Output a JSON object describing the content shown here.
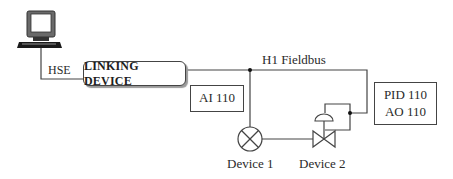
{
  "diagram": {
    "title": "",
    "nodes": {
      "host": {
        "icon": "computer-icon",
        "link_label": "HSE"
      },
      "linking_device": {
        "label": "LINKING DEVICE"
      },
      "bus": {
        "label": "H1 Fieldbus"
      },
      "ai_block": {
        "label": "AI 110"
      },
      "pid_block": {
        "line1": "PID 110",
        "line2": "AO 110"
      },
      "device1": {
        "label": "Device 1",
        "symbol": "instrument-circle-x-icon"
      },
      "device2": {
        "label": "Device 2",
        "symbol": "control-valve-icon"
      }
    },
    "edges": [
      {
        "from": "host",
        "to": "linking_device",
        "label": "HSE"
      },
      {
        "from": "linking_device",
        "to": "bus",
        "label": "H1 Fieldbus"
      },
      {
        "from": "bus",
        "to": "device1"
      },
      {
        "from": "bus",
        "to": "device2"
      },
      {
        "from": "device1",
        "to": "device2"
      }
    ],
    "colors": {
      "line": "#444444",
      "background": "#ffffff"
    }
  }
}
